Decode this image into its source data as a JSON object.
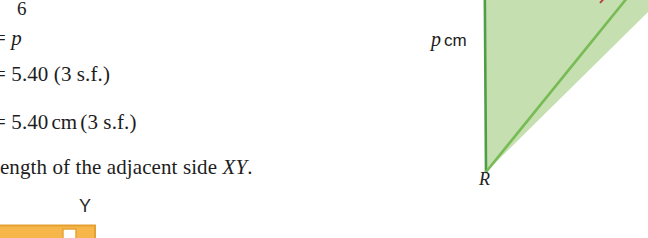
{
  "page": {
    "kind": "textbook-page-fragment",
    "width": 648,
    "height": 238,
    "background": "#ffffff"
  },
  "solution": {
    "lines": [
      {
        "id": "six",
        "text": "6"
      },
      {
        "id": "equals_p",
        "prefix": "= ",
        "variable": "p"
      },
      {
        "id": "value",
        "text": "= 5.40 (3 s.f.)"
      },
      {
        "id": "value_cm",
        "prefix": "= 5.40",
        "unit": "cm",
        "suffix": "(3 s.f.)"
      },
      {
        "id": "adjacent",
        "prefix": "length of the adjacent side ",
        "variable": "XY",
        "suffix": "."
      }
    ]
  },
  "figures": {
    "triangle_green": {
      "name": "right-triangle-PQR",
      "fill": "#c6dfb0",
      "stroke": "#4f9e46",
      "angle_arc_color": "#b4423c",
      "side_label": {
        "variable": "p",
        "unit": "cm"
      },
      "vertex_labels": [
        "R"
      ]
    },
    "shape_orange": {
      "name": "partial-orange-figure",
      "fill": "#f6b64a",
      "stroke": "#e09a2c",
      "right_angle_marker": "#ffffff",
      "vertex_labels": [
        "Y"
      ]
    }
  },
  "colors": {
    "text": "#1d1d1d",
    "green_fill": "#c6dfb0",
    "green_stroke": "#4f9e46",
    "orange_fill": "#f6b64a",
    "orange_stroke": "#e09a2c",
    "red_arc": "#b4423c"
  }
}
